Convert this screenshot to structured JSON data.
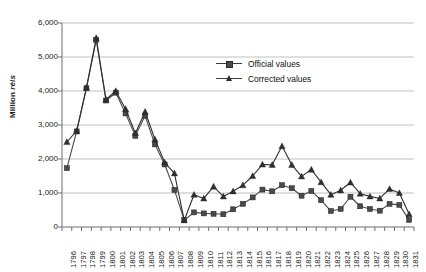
{
  "chart_data": {
    "type": "line",
    "title": "",
    "xlabel": "",
    "ylabel": "Million réis",
    "ylabel_plain": "Million ",
    "ylabel_italic": "réis",
    "ylim": [
      0,
      6000
    ],
    "ytick_values": [
      0,
      1000,
      2000,
      3000,
      4000,
      5000,
      6000
    ],
    "ytick_labels": [
      "0",
      "1,000",
      "2,000",
      "3,000",
      "4,000",
      "5,000",
      "6,000"
    ],
    "grid": true,
    "legend_position": "upper-center-right",
    "categories": [
      "1796",
      "1797",
      "1798",
      "1799",
      "1800",
      "1801",
      "1802",
      "1803",
      "1804",
      "1805",
      "1806",
      "1807",
      "1808",
      "1809",
      "1810",
      "1811",
      "1812",
      "1813",
      "1814",
      "1815",
      "1816",
      "1817",
      "1818",
      "1819",
      "1820",
      "1821",
      "1822",
      "1823",
      "1824",
      "1825",
      "1826",
      "1827",
      "1828",
      "1829",
      "1830",
      "1831"
    ],
    "series": [
      {
        "name": "Official values",
        "marker": "square",
        "color": "#4a4a4a",
        "values": [
          1730,
          2810,
          4080,
          5500,
          3720,
          3950,
          3340,
          2680,
          3270,
          2430,
          1840,
          1090,
          200,
          430,
          400,
          390,
          375,
          520,
          680,
          870,
          1100,
          1050,
          1230,
          1140,
          920,
          1060,
          790,
          470,
          530,
          890,
          610,
          530,
          480,
          680,
          650,
          210
        ]
      },
      {
        "name": "Corrected values",
        "marker": "triangle",
        "color": "#2f2f2f",
        "values": [
          2500,
          2830,
          4100,
          5560,
          3750,
          4000,
          3470,
          2760,
          3390,
          2580,
          1900,
          1580,
          200,
          950,
          840,
          1190,
          900,
          1050,
          1230,
          1500,
          1840,
          1830,
          2380,
          1830,
          1490,
          1690,
          1320,
          950,
          1080,
          1310,
          980,
          900,
          840,
          1120,
          1000,
          380
        ]
      }
    ]
  },
  "legend": {
    "items": [
      {
        "label": "Official values"
      },
      {
        "label": "Corrected values"
      }
    ]
  }
}
